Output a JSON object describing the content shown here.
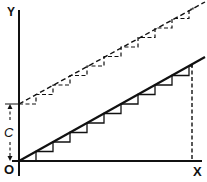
{
  "diagram": {
    "type": "graph-sketch",
    "labels": {
      "y_axis": "Y",
      "x_axis": "X",
      "origin": "O",
      "intercept": "C"
    },
    "elements": [
      {
        "name": "solid-line",
        "description": "Straight line through origin with staircase approximation beneath it",
        "style": "solid"
      },
      {
        "name": "dashed-line",
        "description": "Parallel line offset upward by C with staircase approximation",
        "style": "dashed"
      },
      {
        "name": "vertical-dashed-drop",
        "description": "Dashed vertical line from end of solid line to X axis",
        "style": "dashed"
      },
      {
        "name": "intercept-arrow",
        "description": "Double-headed dashed arrow marking offset C on Y axis",
        "style": "dashed"
      }
    ],
    "steps_solid": 11,
    "steps_dashed": 11,
    "colors": {
      "ink": "#111111",
      "background": "#ffffff"
    }
  }
}
